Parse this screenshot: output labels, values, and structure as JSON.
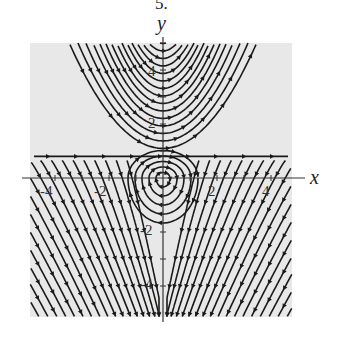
{
  "figure": {
    "number_label": "5.",
    "x_axis_label": "x",
    "y_axis_label": "y",
    "x_tick_labels": [
      "-4",
      "-2",
      "2",
      "4"
    ],
    "y_tick_labels": [
      "4",
      "2",
      "-2",
      "-4"
    ],
    "colors": {
      "plot_background": "#e8e8e8",
      "curves": "#1a1a1a",
      "axes": "#333333"
    }
  },
  "chart_data": {
    "type": "streamplot",
    "title": "5.",
    "xlabel": "x",
    "ylabel": "y",
    "xlim": [
      -5,
      5
    ],
    "ylim": [
      -5,
      5
    ],
    "x_ticks": [
      -4,
      -2,
      2,
      4
    ],
    "y_ticks": [
      -4,
      -2,
      2,
      4
    ],
    "grid": false,
    "features": {
      "separatrix_y": 0.8,
      "center": [
        0,
        0
      ],
      "upper_region": "parabola-like curves opening upward, arrows pointing outward/down sides",
      "lower_region": "closed orbits near origin, then parabola-like curves opening downward"
    }
  }
}
